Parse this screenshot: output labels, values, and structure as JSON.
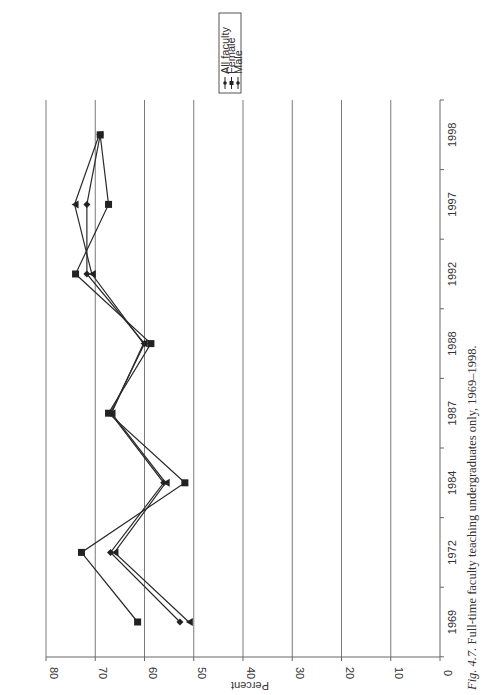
{
  "chart_data": {
    "type": "line",
    "orientation": "rotated-90-clockwise",
    "title": "",
    "caption_prefix": "Fig. 4.7.",
    "caption_text": "Full-time faculty teaching undergraduates only, 1969–1998.",
    "xlabel": "",
    "ylabel": "Percent",
    "categories": [
      "1969",
      "1972",
      "1984",
      "1987",
      "1988",
      "1992",
      "1997",
      "1998"
    ],
    "ylim": [
      0,
      80
    ],
    "yticks": [
      0,
      10,
      20,
      30,
      40,
      50,
      60,
      70,
      80
    ],
    "grid": true,
    "legend_position": "top-right",
    "series": [
      {
        "name": "All faculty",
        "marker": "diamond",
        "values": [
          52.8,
          66.9,
          56.1,
          66.9,
          60.0,
          71.7,
          71.7,
          69.0
        ]
      },
      {
        "name": "Female",
        "marker": "square",
        "values": [
          61.4,
          72.8,
          51.8,
          67.3,
          58.7,
          74.0,
          67.3,
          69.0
        ]
      },
      {
        "name": "Male",
        "marker": "triangle",
        "values": [
          51.0,
          66.1,
          55.7,
          66.7,
          60.2,
          70.7,
          74.2,
          69.2
        ]
      }
    ]
  },
  "legend": {
    "items": [
      "All faculty",
      "Female",
      "Male"
    ]
  },
  "axis": {
    "value_title": "Percent"
  }
}
